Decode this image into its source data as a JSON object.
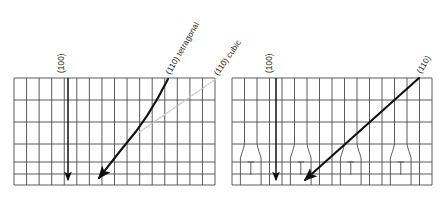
{
  "figure": {
    "title": "",
    "background_color": "#ffffff",
    "line_color": "#4a4a4a",
    "arrow_color": "#111111",
    "guide_color": "#c8c8c8",
    "width": 443,
    "height": 205
  },
  "panels": [
    {
      "name": "left-panel",
      "id": "tetragonal-panel",
      "x": 14,
      "y": 78,
      "width": 201,
      "height": 107,
      "columns": 16,
      "rows": 6,
      "row_boundaries": [
        0,
        22,
        44,
        66,
        84,
        96,
        107
      ],
      "domain_walls": false,
      "annotations": [
        {
          "name": "annotation-100-left",
          "label": "(100)",
          "type": "straight-arrow",
          "x1": 68,
          "y1": 78,
          "x2": 68,
          "y2": 182,
          "label_x": 63,
          "label_y": 72,
          "label_rotation": -90
        },
        {
          "name": "annotation-110-tetragonal",
          "label": "(110) tetragonal",
          "type": "curved-arrow",
          "x1": 168,
          "y1": 79,
          "x2": 97,
          "y2": 181,
          "label_x": 175,
          "label_y": 70,
          "label_rotation": -60
        },
        {
          "name": "guide-110-cubic",
          "label": "(110) cubic",
          "type": "dotted-guide",
          "x1": 215,
          "y1": 80,
          "x2": 140,
          "y2": 130,
          "label_x": 222,
          "label_y": 70,
          "label_rotation": -55
        }
      ]
    },
    {
      "name": "right-panel",
      "id": "cubic-panel",
      "x": 232,
      "y": 78,
      "width": 200,
      "height": 107,
      "columns": 16,
      "rows": 6,
      "row_boundaries": [
        0,
        22,
        44,
        66,
        84,
        96,
        107
      ],
      "domain_walls": true,
      "domain_wall_count": 4,
      "domain_wall_centers": [
        246,
        296,
        346,
        396
      ],
      "annotations": [
        {
          "name": "annotation-100-right",
          "label": "(100)",
          "type": "straight-arrow",
          "x1": 276,
          "y1": 78,
          "x2": 276,
          "y2": 182,
          "label_x": 271,
          "label_y": 72,
          "label_rotation": -90
        },
        {
          "name": "annotation-110-cubic-arrow",
          "label": "(110)",
          "type": "straight-arrow",
          "x1": 418,
          "y1": 79,
          "x2": 303,
          "y2": 181,
          "label_x": 424,
          "label_y": 70,
          "label_rotation": -58
        }
      ]
    }
  ],
  "labels": {
    "left_100": "(100)",
    "left_110_tetragonal": "(110) tetragonal",
    "cubic_guide": "(110) cubic",
    "right_100": "(100)",
    "right_110": "(110)"
  }
}
